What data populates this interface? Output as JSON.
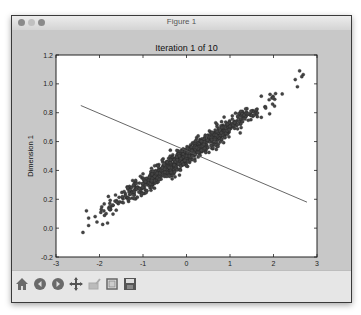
{
  "window": {
    "title": "Figure 1"
  },
  "figure": {
    "title": "Iteration 1 of 10"
  },
  "toolbar": {
    "buttons": [
      {
        "name": "home",
        "icon": "home-icon"
      },
      {
        "name": "back",
        "icon": "back-arrow-icon"
      },
      {
        "name": "forward",
        "icon": "forward-arrow-icon"
      },
      {
        "name": "pan",
        "icon": "pan-move-icon"
      },
      {
        "name": "zoom",
        "icon": "zoom-rect-icon"
      },
      {
        "name": "subplots",
        "icon": "subplots-config-icon"
      },
      {
        "name": "save",
        "icon": "save-floppy-icon"
      }
    ]
  },
  "chart_data": {
    "type": "scatter",
    "title": "Iteration 1 of 10",
    "xlabel": "Dimension 0",
    "ylabel": "Dimension 1",
    "xlim": [
      -3,
      3
    ],
    "ylim": [
      -0.2,
      1.2
    ],
    "xticks": [
      "-3",
      "-2",
      "-1",
      "0",
      "1",
      "2",
      "3"
    ],
    "yticks": [
      "-0.2",
      "0.0",
      "0.2",
      "0.4",
      "0.6",
      "0.8",
      "1.0",
      "1.2"
    ],
    "grid": false,
    "legend": null,
    "series": [
      {
        "name": "points",
        "kind": "scatter",
        "color": "#444444",
        "description": "~1000 points along a linear trend y ≈ 0.5 + 0.2x with small noise",
        "trend": {
          "slope": 0.2,
          "intercept": 0.5,
          "noise_sd": 0.035
        },
        "x_range": [
          -2.4,
          2.7
        ],
        "sample_points": [
          [
            -2.38,
            -0.03
          ],
          [
            -2.3,
            0.12
          ],
          [
            -2.25,
            0.07
          ],
          [
            -2.1,
            0.08
          ],
          [
            -1.9,
            0.12
          ],
          [
            -1.6,
            0.18
          ],
          [
            -1.2,
            0.25
          ],
          [
            -0.8,
            0.33
          ],
          [
            -0.4,
            0.42
          ],
          [
            0.0,
            0.5
          ],
          [
            0.4,
            0.58
          ],
          [
            0.8,
            0.66
          ],
          [
            1.2,
            0.74
          ],
          [
            1.6,
            0.82
          ],
          [
            1.9,
            0.89
          ],
          [
            2.2,
            0.93
          ],
          [
            2.5,
            1.03
          ],
          [
            2.6,
            1.09
          ],
          [
            2.65,
            1.05
          ],
          [
            2.55,
            0.98
          ]
        ]
      },
      {
        "name": "direction line",
        "kind": "line",
        "color": "#555555",
        "x": [
          -2.43,
          2.77
        ],
        "y": [
          0.85,
          0.18
        ]
      }
    ]
  }
}
